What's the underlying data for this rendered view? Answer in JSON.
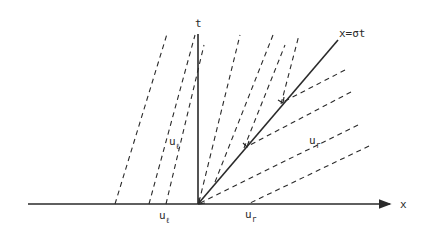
{
  "diagram": {
    "title": "",
    "colors": {
      "ink": "#2a2a2a",
      "background": "#ffffff"
    },
    "axes": {
      "x": {
        "label": "x",
        "from": [
          28,
          204
        ],
        "to": [
          392,
          204
        ]
      },
      "t": {
        "label": "t",
        "from": [
          198,
          204
        ],
        "to": [
          198,
          33
        ]
      }
    },
    "shock": {
      "label": "x=σt",
      "from": [
        198,
        204
      ],
      "to": [
        338,
        40
      ]
    },
    "left_characteristics": [
      {
        "from": [
          115,
          204
        ],
        "to": [
          167,
          34
        ]
      },
      {
        "from": [
          149,
          204
        ],
        "to": [
          195,
          35
        ]
      },
      {
        "from": [
          166,
          204
        ],
        "to": [
          204,
          45
        ]
      }
    ],
    "upper_right_characteristics": [
      {
        "from": [
          198,
          204
        ],
        "to": [
          240,
          35
        ]
      },
      {
        "from": [
          215,
          182
        ],
        "to": [
          273,
          35
        ]
      },
      {
        "from": [
          244,
          148
        ],
        "to": [
          299,
          35
        ]
      }
    ],
    "lower_right_characteristics": [
      {
        "from": [
          283,
          102
        ],
        "to": [
          345,
          70
        ]
      },
      {
        "from": [
          248,
          146
        ],
        "to": [
          351,
          92
        ]
      },
      {
        "from": [
          198,
          204
        ],
        "to": [
          358,
          125
        ]
      },
      {
        "from": [
          248,
          204
        ],
        "to": [
          369,
          146
        ]
      }
    ],
    "labels": {
      "t_axis": "t",
      "x_axis": "x",
      "shock": "x=σt",
      "u_left_base": "u",
      "u_left_sub": "ℓ",
      "u_right_base": "u",
      "u_right_sub": "r"
    }
  }
}
